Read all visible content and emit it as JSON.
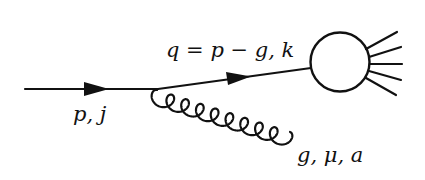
{
  "diagram": {
    "type": "feynman-diagram",
    "background": "#ffffff",
    "stroke": "#111111",
    "labels": {
      "incoming": "p, j",
      "internal": "q = p − g, k",
      "gluon": "g, μ, a"
    },
    "elements": [
      {
        "kind": "fermion-line",
        "role": "incoming-quark",
        "label": "p, j",
        "direction": "right"
      },
      {
        "kind": "fermion-line",
        "role": "internal-quark",
        "label": "q = p − g, k",
        "direction": "up-right"
      },
      {
        "kind": "gluon",
        "role": "emitted-gluon",
        "label": "g, μ, a"
      },
      {
        "kind": "blob",
        "role": "hard-process",
        "outgoing_lines": 5
      }
    ]
  }
}
